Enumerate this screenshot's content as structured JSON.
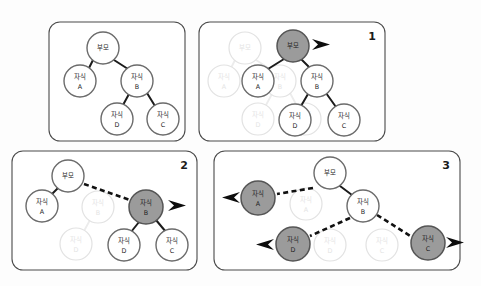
{
  "figure": {
    "background_color": "#fdfdfd",
    "node_fill": "#ffffff",
    "node_highlight_fill": "#9b9b9b",
    "node_stroke": "#6b6b6b",
    "ghost_stroke": "#e2e2e2",
    "edge_color": "#1b1b1b",
    "panel_border_color": "#4a4a4a",
    "labels": {
      "parent": "부모",
      "child_a_line1": "자식",
      "child_a_line2": "A",
      "child_b_line1": "자식",
      "child_b_line2": "B",
      "child_c_line1": "자식",
      "child_c_line2": "C",
      "child_d_line1": "자식",
      "child_d_line2": "D"
    }
  },
  "panels": [
    {
      "id": "panel-initial",
      "number": "",
      "number_visible": false,
      "description": "initial tree",
      "nodes": [
        {
          "name": "parent",
          "label1": "부모",
          "label2": "",
          "x": 103,
          "y": 48,
          "r": 16,
          "state": "normal"
        },
        {
          "name": "child-a",
          "label1": "자식",
          "label2": "A",
          "x": 80,
          "y": 81,
          "r": 16,
          "state": "normal"
        },
        {
          "name": "child-b",
          "label1": "자식",
          "label2": "B",
          "x": 137,
          "y": 81,
          "r": 16,
          "state": "normal"
        },
        {
          "name": "child-d",
          "label1": "자식",
          "label2": "D",
          "x": 117,
          "y": 119,
          "r": 16,
          "state": "normal"
        },
        {
          "name": "child-c",
          "label1": "자식",
          "label2": "C",
          "x": 163,
          "y": 119,
          "r": 16,
          "state": "normal"
        }
      ]
    },
    {
      "id": "panel-1",
      "number": "1",
      "number_visible": true,
      "description": "parent node selected and emitted",
      "nodes": [
        {
          "name": "parent-ghost",
          "label1": "부모",
          "label2": "",
          "x": 245,
          "y": 48,
          "r": 16,
          "state": "ghost"
        },
        {
          "name": "child-a-ghost",
          "label1": "자식",
          "label2": "A",
          "x": 224,
          "y": 81,
          "r": 16,
          "state": "ghost"
        },
        {
          "name": "child-b-ghost",
          "label1": "자식",
          "label2": "B",
          "x": 280,
          "y": 81,
          "r": 16,
          "state": "ghost"
        },
        {
          "name": "child-d-ghost",
          "label1": "자식",
          "label2": "D",
          "x": 258,
          "y": 119,
          "r": 16,
          "state": "ghost"
        },
        {
          "name": "child-c-ghost",
          "label1": "자식",
          "label2": "C",
          "x": 305,
          "y": 119,
          "r": 16,
          "state": "ghost"
        },
        {
          "name": "parent",
          "label1": "부모",
          "label2": "",
          "x": 293,
          "y": 46,
          "r": 16,
          "state": "highlight"
        },
        {
          "name": "child-a",
          "label1": "자식",
          "label2": "A",
          "x": 258,
          "y": 81,
          "r": 16,
          "state": "normal"
        },
        {
          "name": "child-b",
          "label1": "자식",
          "label2": "B",
          "x": 317,
          "y": 81,
          "r": 16,
          "state": "normal"
        },
        {
          "name": "child-d",
          "label1": "자식",
          "label2": "D",
          "x": 295,
          "y": 120,
          "r": 16,
          "state": "normal"
        },
        {
          "name": "child-c",
          "label1": "자식",
          "label2": "C",
          "x": 344,
          "y": 120,
          "r": 16,
          "state": "normal"
        }
      ],
      "arrows": [
        {
          "name": "emit-arrow-parent",
          "direction": "right",
          "x": 314,
          "y": 42
        }
      ]
    },
    {
      "id": "panel-2",
      "number": "2",
      "number_visible": true,
      "description": "child B selected and emitted",
      "nodes": [
        {
          "name": "child-b-ghost",
          "label1": "자식",
          "label2": "B",
          "x": 98,
          "y": 207,
          "r": 16,
          "state": "ghost"
        },
        {
          "name": "child-d-ghost",
          "label1": "자식",
          "label2": "D",
          "x": 76,
          "y": 244,
          "r": 16,
          "state": "ghost"
        },
        {
          "name": "parent",
          "label1": "부모",
          "label2": "",
          "x": 68,
          "y": 176,
          "r": 16,
          "state": "normal"
        },
        {
          "name": "child-a",
          "label1": "자식",
          "label2": "A",
          "x": 42,
          "y": 206,
          "r": 16,
          "state": "normal"
        },
        {
          "name": "child-b",
          "label1": "자식",
          "label2": "B",
          "x": 146,
          "y": 207,
          "r": 17,
          "state": "highlight"
        },
        {
          "name": "child-d",
          "label1": "자식",
          "label2": "D",
          "x": 124,
          "y": 245,
          "r": 16,
          "state": "normal"
        },
        {
          "name": "child-c",
          "label1": "자식",
          "label2": "C",
          "x": 172,
          "y": 245,
          "r": 16,
          "state": "normal"
        }
      ],
      "arrows": [
        {
          "name": "emit-arrow-child-b",
          "direction": "right",
          "x": 170,
          "y": 203
        }
      ]
    },
    {
      "id": "panel-3",
      "number": "3",
      "number_visible": true,
      "description": "remaining leaves A, D, C emitted",
      "nodes": [
        {
          "name": "child-a-ghost",
          "label1": "자식",
          "label2": "A",
          "x": 306,
          "y": 204,
          "r": 16,
          "state": "ghost"
        },
        {
          "name": "child-d-ghost",
          "label1": "자식",
          "label2": "D",
          "x": 330,
          "y": 245,
          "r": 16,
          "state": "ghost"
        },
        {
          "name": "child-c-ghost",
          "label1": "자식",
          "label2": "C",
          "x": 382,
          "y": 245,
          "r": 16,
          "state": "ghost"
        },
        {
          "name": "parent",
          "label1": "부모",
          "label2": "",
          "x": 330,
          "y": 173,
          "r": 16,
          "state": "normal"
        },
        {
          "name": "child-b",
          "label1": "자식",
          "label2": "B",
          "x": 363,
          "y": 206,
          "r": 16,
          "state": "normal"
        },
        {
          "name": "child-a",
          "label1": "자식",
          "label2": "A",
          "x": 258,
          "y": 198,
          "r": 17,
          "state": "highlight"
        },
        {
          "name": "child-d",
          "label1": "자식",
          "label2": "D",
          "x": 293,
          "y": 244,
          "r": 17,
          "state": "highlight"
        },
        {
          "name": "child-c",
          "label1": "자식",
          "label2": "C",
          "x": 428,
          "y": 243,
          "r": 17,
          "state": "highlight"
        }
      ],
      "arrows": [
        {
          "name": "emit-arrow-child-a",
          "direction": "left",
          "x": 232,
          "y": 195
        },
        {
          "name": "emit-arrow-child-d",
          "direction": "left",
          "x": 266,
          "y": 242
        },
        {
          "name": "emit-arrow-child-c",
          "direction": "right",
          "x": 450,
          "y": 240
        }
      ]
    }
  ]
}
